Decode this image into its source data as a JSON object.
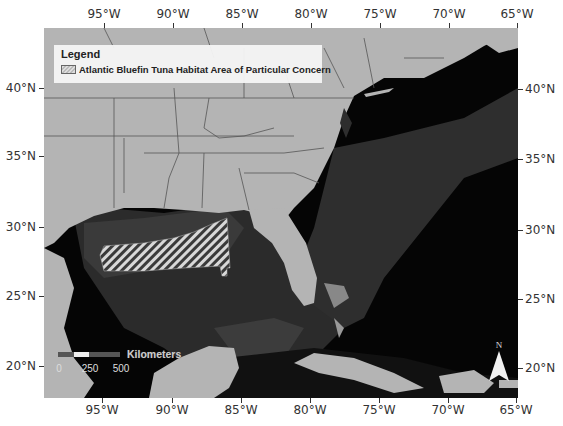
{
  "map": {
    "title": "Atlantic Bluefin Tuna Habitat Area of Particular Concern map",
    "legend": {
      "title": "Legend",
      "items": [
        {
          "label": "Atlantic Bluefin Tuna Habitat Area of Particular Concern",
          "symbol": "diagonal-hatch"
        }
      ]
    },
    "longitude_labels_top": [
      "95°W",
      "90°W",
      "85°W",
      "80°W",
      "75°W",
      "70°W",
      "65°W"
    ],
    "longitude_labels_bottom": [
      "95°W",
      "90°W",
      "85°W",
      "80°W",
      "75°W",
      "70°W",
      "65°W"
    ],
    "latitude_labels_left": [
      "40°N",
      "35°N",
      "30°N",
      "25°N",
      "20°N"
    ],
    "latitude_labels_right": [
      "40°N",
      "35°N",
      "30°N",
      "25°N",
      "20°N"
    ],
    "scale_bar": {
      "unit": "Kilometers",
      "labels": [
        "0",
        "250",
        "500"
      ]
    },
    "north_arrow": {
      "label": "N"
    },
    "colors": {
      "land": "#b4b4b4",
      "shelf_water": "#3c3c3c",
      "deep_water": "#050505",
      "hatch_light": "#d8d8d8",
      "borders": "#555555"
    }
  }
}
